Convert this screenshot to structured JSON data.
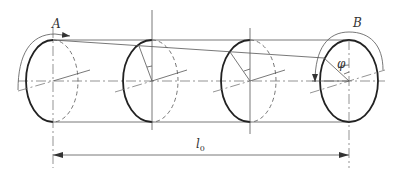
{
  "diagram": {
    "labels": {
      "point_a": "A",
      "point_b": "B",
      "angle": "φ",
      "length_main": "l",
      "length_sub": "0"
    },
    "geometry": {
      "centerline_y": 81,
      "top_y": 40,
      "bottom_y": 122,
      "sections_x": [
        53,
        152,
        250,
        349
      ],
      "dimension_y": 155
    },
    "colors": {
      "line": "#555555",
      "thick_line": "#222222",
      "background": "#ffffff"
    }
  }
}
